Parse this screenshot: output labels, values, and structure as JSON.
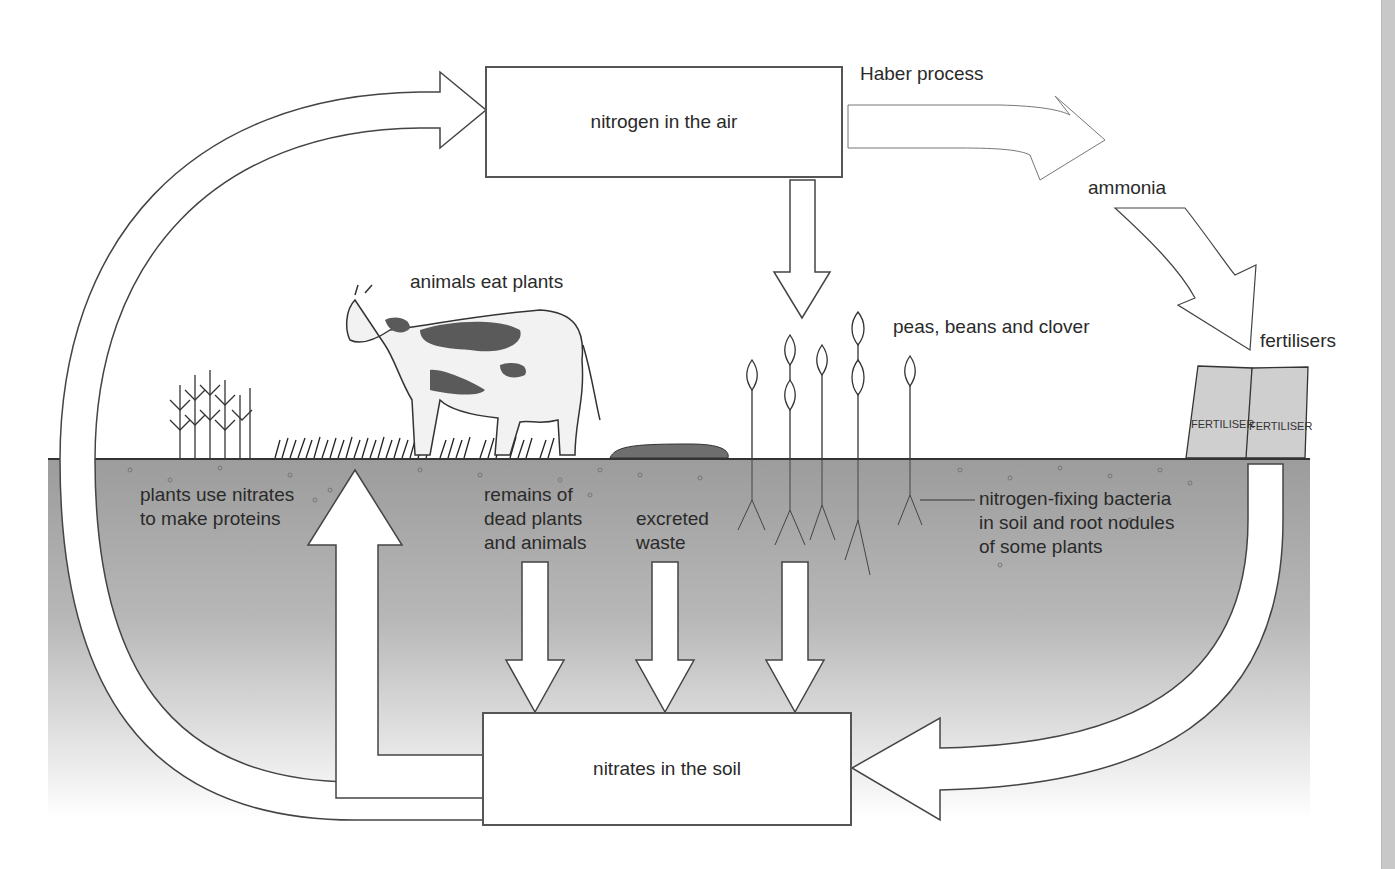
{
  "diagram": {
    "boxes": {
      "air": "nitrogen in the air",
      "soil": "nitrates in the soil"
    },
    "labels": {
      "haber": "Haber process",
      "ammonia": "ammonia",
      "fertilisers": "fertilisers",
      "animals_eat": "animals eat plants",
      "legumes": "peas, beans and clover",
      "plants_use_1": "plants use nitrates",
      "plants_use_2": "to make proteins",
      "remains_1": "remains of",
      "remains_2": "dead plants",
      "remains_3": "and animals",
      "excreted_1": "excreted",
      "excreted_2": "waste",
      "bacteria_1": "nitrogen-fixing bacteria",
      "bacteria_2": "in soil and root nodules",
      "bacteria_3": "of some plants",
      "bag_text": "FERTILISER"
    },
    "colors": {
      "soil_top": "#9a9a9a",
      "soil_bottom": "#ffffff",
      "outline": "#444444",
      "cow_patch": "#5a5a5a"
    }
  }
}
